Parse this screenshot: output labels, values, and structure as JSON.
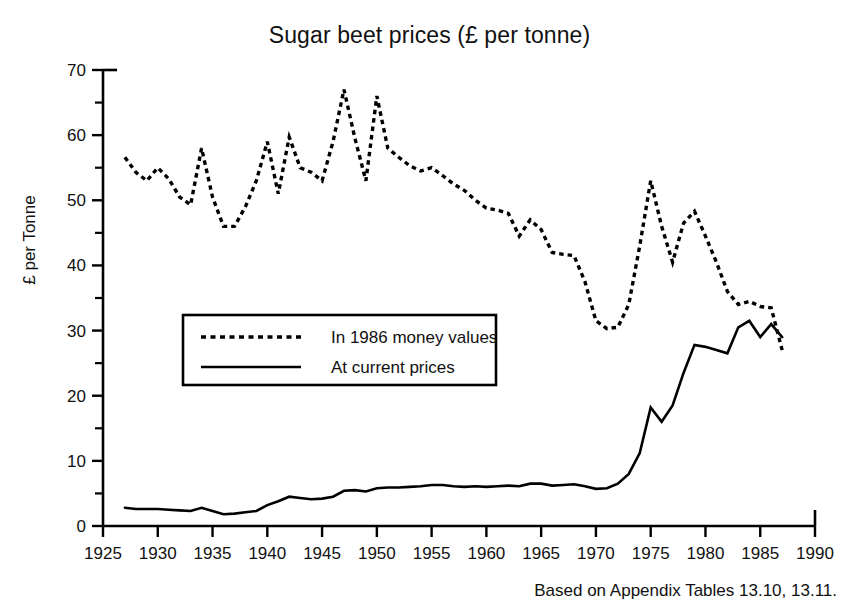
{
  "chart_data": {
    "type": "line",
    "title": "Sugar beet prices (£ per tonne)",
    "xlabel": "",
    "ylabel": "£ per Tonne",
    "xlim": [
      1925,
      1990
    ],
    "ylim": [
      0,
      70
    ],
    "xticks": [
      1925,
      1930,
      1935,
      1940,
      1945,
      1950,
      1955,
      1960,
      1965,
      1970,
      1975,
      1980,
      1985,
      1990
    ],
    "yticks": [
      0,
      10,
      20,
      30,
      40,
      50,
      60,
      70
    ],
    "minor_yticks": [
      5,
      15,
      25,
      35,
      45,
      55,
      65
    ],
    "grid": false,
    "legend_position": "center-left",
    "footnote": "Based on Appendix Tables 13.10, 13.11.",
    "series": [
      {
        "name": "In 1986 money values",
        "style": "dotted",
        "color": "#000000",
        "x": [
          1927,
          1928,
          1929,
          1930,
          1931,
          1932,
          1933,
          1934,
          1935,
          1936,
          1937,
          1938,
          1939,
          1940,
          1941,
          1942,
          1943,
          1944,
          1945,
          1946,
          1947,
          1948,
          1949,
          1950,
          1951,
          1952,
          1953,
          1954,
          1955,
          1956,
          1957,
          1958,
          1959,
          1960,
          1961,
          1962,
          1963,
          1964,
          1965,
          1966,
          1967,
          1968,
          1969,
          1970,
          1971,
          1972,
          1973,
          1974,
          1975,
          1976,
          1977,
          1978,
          1979,
          1980,
          1981,
          1982,
          1983,
          1984,
          1985,
          1986,
          1987
        ],
        "y": [
          56.6,
          54.3,
          53.0,
          55.0,
          53.3,
          50.5,
          49.3,
          58.0,
          50.5,
          46.0,
          46.0,
          49.0,
          53.0,
          59.0,
          51.0,
          59.7,
          55.0,
          54.3,
          53.0,
          59.0,
          67.0,
          59.5,
          53.0,
          66.0,
          58.0,
          56.6,
          55.3,
          54.5,
          55.0,
          53.8,
          52.5,
          51.5,
          50.0,
          48.8,
          48.5,
          48.0,
          44.5,
          47.0,
          45.5,
          42.0,
          41.7,
          41.5,
          37.5,
          31.5,
          30.3,
          30.5,
          34.0,
          43.0,
          53.0,
          46.0,
          40.5,
          46.5,
          48.3,
          44.5,
          40.5,
          36.0,
          34.0,
          34.5,
          33.7,
          33.5,
          27.0
        ]
      },
      {
        "name": "At current prices",
        "style": "solid",
        "color": "#000000",
        "x": [
          1927,
          1928,
          1929,
          1930,
          1931,
          1932,
          1933,
          1934,
          1935,
          1936,
          1937,
          1938,
          1939,
          1940,
          1941,
          1942,
          1943,
          1944,
          1945,
          1946,
          1947,
          1948,
          1949,
          1950,
          1951,
          1952,
          1953,
          1954,
          1955,
          1956,
          1957,
          1958,
          1959,
          1960,
          1961,
          1962,
          1963,
          1964,
          1965,
          1966,
          1967,
          1968,
          1969,
          1970,
          1971,
          1972,
          1973,
          1974,
          1975,
          1976,
          1977,
          1978,
          1979,
          1980,
          1981,
          1982,
          1983,
          1984,
          1985,
          1986,
          1987
        ],
        "y": [
          2.8,
          2.6,
          2.6,
          2.6,
          2.5,
          2.4,
          2.3,
          2.8,
          2.3,
          1.8,
          1.9,
          2.1,
          2.3,
          3.2,
          3.8,
          4.5,
          4.3,
          4.1,
          4.2,
          4.5,
          5.4,
          5.5,
          5.3,
          5.8,
          5.9,
          5.9,
          6.0,
          6.1,
          6.3,
          6.3,
          6.1,
          6.0,
          6.1,
          6.0,
          6.1,
          6.2,
          6.1,
          6.5,
          6.5,
          6.2,
          6.3,
          6.4,
          6.1,
          5.7,
          5.8,
          6.5,
          8.0,
          11.2,
          18.2,
          16.0,
          18.5,
          23.5,
          27.8,
          27.5,
          27.0,
          26.5,
          30.5,
          31.5,
          29.0,
          31.0,
          29.0
        ]
      }
    ]
  },
  "legend": {
    "entries": [
      {
        "label": "In 1986 money values",
        "style": "dotted"
      },
      {
        "label": "At current prices",
        "style": "solid"
      }
    ]
  }
}
